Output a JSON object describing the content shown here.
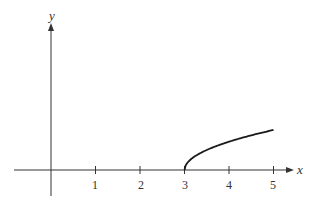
{
  "chart_data": {
    "type": "line",
    "title": "",
    "xlabel": "x",
    "ylabel": "y",
    "function": "y = sqrt(x - 3)",
    "domain": [
      3,
      5
    ],
    "x_ticks": [
      1,
      2,
      3,
      4,
      5
    ],
    "x_tick_labels": [
      "1",
      "2",
      "3",
      "4",
      "5"
    ],
    "y_ticks": [],
    "xlim": [
      -0.8,
      5.4
    ],
    "grid": false,
    "legend": null,
    "series": [
      {
        "name": "curve",
        "x": [
          3,
          3.05,
          3.1,
          3.25,
          3.5,
          3.75,
          4,
          4.25,
          4.5,
          4.75,
          5
        ],
        "y": [
          0,
          0.224,
          0.316,
          0.5,
          0.707,
          0.866,
          1.0,
          1.118,
          1.225,
          1.323,
          1.414
        ],
        "color": "#1a1a1a"
      }
    ]
  },
  "labels": {
    "x_axis": "x",
    "y_axis": "y",
    "ticks": [
      "1",
      "2",
      "3",
      "4",
      "5"
    ]
  }
}
